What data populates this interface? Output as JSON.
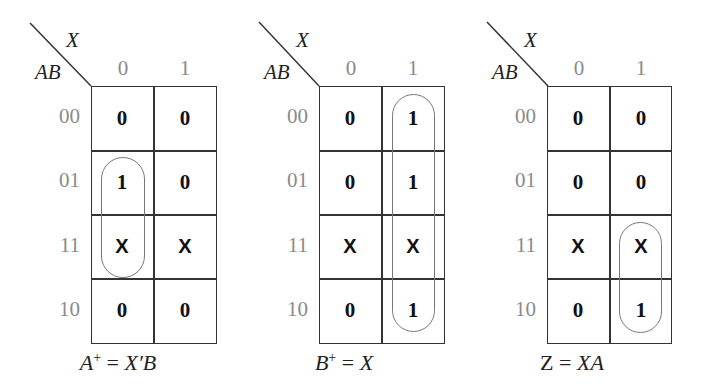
{
  "maps": [
    {
      "id": "A_plus",
      "column_variable": "X",
      "row_variables": "AB",
      "column_labels": [
        "0",
        "1"
      ],
      "row_labels": [
        "00",
        "01",
        "11",
        "10"
      ],
      "cells": [
        [
          "0",
          "0"
        ],
        [
          "1",
          "0"
        ],
        [
          "X",
          "X"
        ],
        [
          "0",
          "0"
        ]
      ],
      "loops": [
        {
          "column": 0,
          "rows": [
            "01",
            "11"
          ]
        }
      ],
      "equation": {
        "lhs": "A",
        "sup": "+",
        "eq": " = ",
        "rhs": "X′B"
      }
    },
    {
      "id": "B_plus",
      "column_variable": "X",
      "row_variables": "AB",
      "column_labels": [
        "0",
        "1"
      ],
      "row_labels": [
        "00",
        "01",
        "11",
        "10"
      ],
      "cells": [
        [
          "0",
          "1"
        ],
        [
          "0",
          "1"
        ],
        [
          "X",
          "X"
        ],
        [
          "0",
          "1"
        ]
      ],
      "loops": [
        {
          "column": 1,
          "rows": [
            "00",
            "01",
            "11",
            "10"
          ]
        }
      ],
      "equation": {
        "lhs": "B",
        "sup": "+",
        "eq": " = ",
        "rhs": "X"
      }
    },
    {
      "id": "Z",
      "column_variable": "X",
      "row_variables": "AB",
      "column_labels": [
        "0",
        "1"
      ],
      "row_labels": [
        "00",
        "01",
        "11",
        "10"
      ],
      "cells": [
        [
          "0",
          "0"
        ],
        [
          "0",
          "0"
        ],
        [
          "X",
          "X"
        ],
        [
          "0",
          "1"
        ]
      ],
      "loops": [
        {
          "column": 1,
          "rows": [
            "11",
            "10"
          ]
        }
      ],
      "equation": {
        "lhs": "Z",
        "sup": "",
        "eq": " = ",
        "rhs": "XA"
      }
    }
  ]
}
